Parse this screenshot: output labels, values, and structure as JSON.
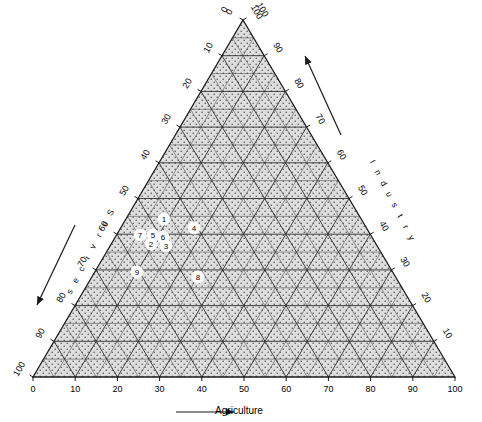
{
  "chart_data": {
    "type": "scatter",
    "plot_kind": "ternary-diagram",
    "title": "",
    "axes": {
      "bottom": {
        "label": "Agriculture",
        "ticks": [
          0,
          10,
          20,
          30,
          40,
          50,
          60,
          70,
          80,
          90,
          100
        ],
        "direction_arrow": "right",
        "range": [
          0,
          100
        ]
      },
      "right": {
        "label": "Industry",
        "label_letters": [
          "I",
          "n",
          "d",
          "u",
          "s",
          "t",
          "r",
          "y"
        ],
        "ticks": [
          10,
          20,
          30,
          40,
          50,
          60,
          70,
          80,
          90,
          100
        ],
        "direction_arrow": "up-right",
        "range": [
          0,
          100
        ]
      },
      "left": {
        "label": "Services",
        "label_letters": [
          "S",
          "e",
          "r",
          "v",
          "i",
          "c",
          "e",
          "s"
        ],
        "ticks": [
          0,
          10,
          20,
          30,
          40,
          50,
          60,
          70,
          80,
          90,
          100
        ],
        "direction_arrow": "down-left",
        "range": [
          0,
          100
        ]
      }
    },
    "apex_labels": {
      "left_of_apex": "0",
      "right_of_apex": "100"
    },
    "grid": {
      "on": true,
      "interval": 5,
      "fill": "stipple"
    },
    "legend": {
      "position": "none",
      "entries": []
    },
    "series": [
      {
        "name": "countries",
        "marker": "numbered-circle",
        "points": [
          {
            "label": "1",
            "agriculture": 31,
            "industry": 22,
            "services": 47,
            "px": 164,
            "py": 219
          },
          {
            "label": "2",
            "agriculture": 27,
            "industry": 21,
            "services": 52,
            "px": 151,
            "py": 244
          },
          {
            "label": "3",
            "agriculture": 31,
            "industry": 20,
            "services": 49,
            "px": 166,
            "py": 246
          },
          {
            "label": "4",
            "agriculture": 38,
            "industry": 22,
            "services": 40,
            "px": 194,
            "py": 228
          },
          {
            "label": "5",
            "agriculture": 28,
            "industry": 23,
            "services": 49,
            "px": 153,
            "py": 235
          },
          {
            "label": "6",
            "agriculture": 31,
            "industry": 22,
            "services": 47,
            "px": 163,
            "py": 237
          },
          {
            "label": "7",
            "agriculture": 25,
            "industry": 24,
            "services": 51,
            "px": 140,
            "py": 235
          },
          {
            "label": "8",
            "agriculture": 39,
            "industry": 14,
            "services": 47,
            "px": 198,
            "py": 277
          },
          {
            "label": "9",
            "agriculture": 25,
            "industry": 16,
            "services": 59,
            "px": 137,
            "py": 272
          }
        ]
      }
    ]
  },
  "geometry": {
    "apex": {
      "x": 243,
      "y": 20
    },
    "bottom_left": {
      "x": 33,
      "y": 377
    },
    "bottom_right": {
      "x": 455,
      "y": 377
    }
  },
  "colors": {
    "line": "#1a1a1a",
    "fill": "#d8d8d8",
    "stipple": "#5a5a5a",
    "marker_fill": "#ffffff",
    "text": "#000000",
    "background": "#ffffff"
  }
}
